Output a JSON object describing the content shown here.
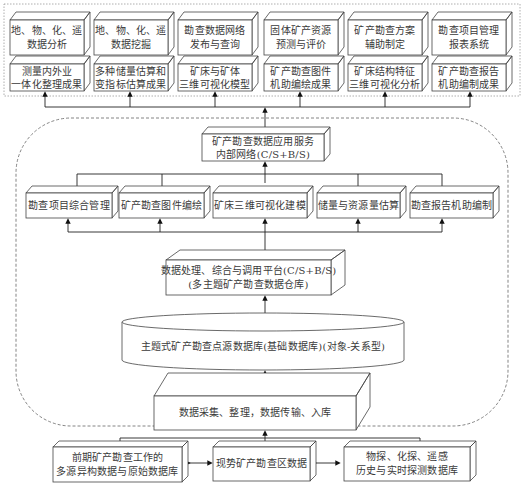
{
  "diagram": {
    "top_row1": [
      {
        "line1": "地、物、化、遥",
        "line2": "数据分析"
      },
      {
        "line1": "地、物、化、遥",
        "line2": "数据挖掘"
      },
      {
        "line1": "勘查数据网络",
        "line2": "发布与查询"
      },
      {
        "line1": "固体矿产资源",
        "line2": "预测与评价"
      },
      {
        "line1": "矿产勘查方案",
        "line2": "辅助制定"
      },
      {
        "line1": "勘查项目管理",
        "line2": "报表系统"
      }
    ],
    "top_row2": [
      {
        "line1": "测量内外业",
        "line2": "一体化整理成果"
      },
      {
        "line1": "多种储量估算和",
        "line2": "变指标估算成果"
      },
      {
        "line1": "矿床与矿体",
        "line2": "三维可视化模型"
      },
      {
        "line1": "矿产勘查图件",
        "line2": "机助编绘成果"
      },
      {
        "line1": "矿床结构特征",
        "line2": "三维可视化分析"
      },
      {
        "line1": "矿产勘查报告",
        "line2": "机助编制成果"
      }
    ],
    "app_service": {
      "line1": "矿产勘查数据应用服务",
      "line2": "内部网络(C/S+B/S)"
    },
    "modules": [
      {
        "label": "勘查项目综合管理"
      },
      {
        "label": "矿产勘查图件编绘"
      },
      {
        "label": "矿床三维可视化建模"
      },
      {
        "label": "储量与资源量估算"
      },
      {
        "label": "勘查报告机助编制"
      }
    ],
    "platform": {
      "line1": "数据处理、综合与调用平台(C/S+B/S)",
      "line2": "(多主题矿产勘查数据仓库)"
    },
    "database": {
      "label": "主题式矿产勘查点源数据库(基础数据库)(对象-关系型)"
    },
    "collection": {
      "label": "数据采集、整理，数据传输、入库"
    },
    "sources": [
      {
        "line1": "前期矿产勘查工作的",
        "line2": "多源异构数据与原始数据库"
      },
      {
        "label": "现势矿产勘查区数据"
      },
      {
        "line1": "物探、化探、遥感",
        "line2": "历史与实时探测数据库"
      }
    ]
  }
}
